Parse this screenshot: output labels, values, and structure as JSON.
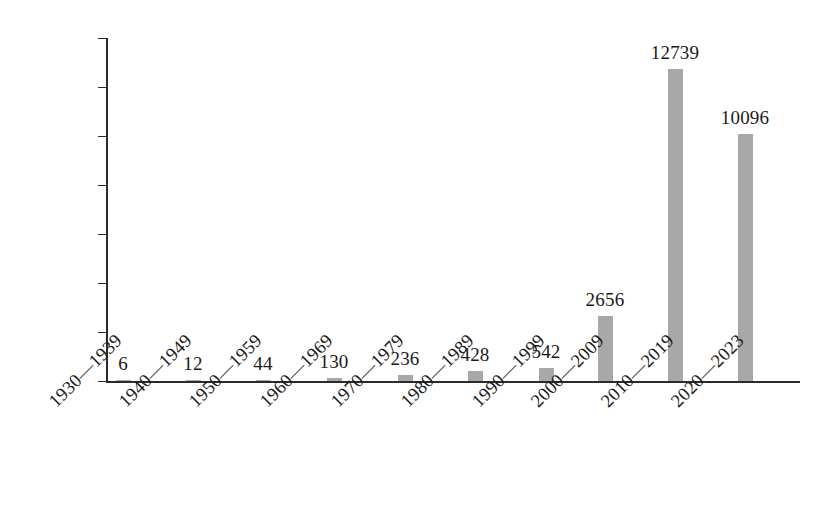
{
  "chart_data": {
    "type": "bar",
    "title": "",
    "subtitle": "",
    "xlabel": "",
    "ylabel": "",
    "categories": [
      "1930—1939",
      "1940—1949",
      "1950—1959",
      "1960—1969",
      "1970—1979",
      "1980—1989",
      "1990—1999",
      "2000—2009",
      "2010—2019",
      "2020—2023"
    ],
    "values": [
      6,
      12,
      44,
      130,
      236,
      428,
      542,
      2656,
      12739,
      10096
    ],
    "value_labels": [
      "6",
      "12",
      "44",
      "130",
      "236",
      "428",
      "542",
      "2656",
      "12739",
      "10096"
    ],
    "ylim": [
      0,
      14000
    ],
    "ytick_values": [
      0,
      2000,
      4000,
      6000,
      8000,
      10000,
      12000,
      14000
    ],
    "ytick_labels": [
      "0",
      "2000",
      "4000",
      "6000",
      "8000",
      "10000",
      "12000",
      "14000"
    ],
    "grid": false,
    "legend": false,
    "legend_position": "none",
    "bar_color": "#a8a8a8",
    "axis_color": "#2b2b2b",
    "text_color": "#1a1a1a",
    "background_color": "#ffffff",
    "category_label_rotation_deg": -45
  }
}
